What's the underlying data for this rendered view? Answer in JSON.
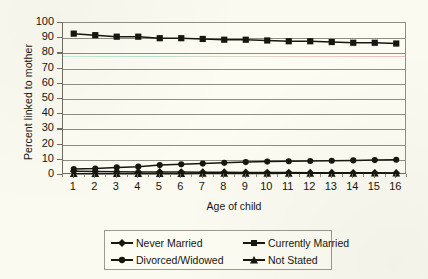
{
  "chart_data": {
    "type": "line",
    "title": "",
    "xlabel": "Age of child",
    "ylabel": "Percent linked to mother",
    "x": [
      1,
      2,
      3,
      4,
      5,
      6,
      7,
      8,
      9,
      10,
      11,
      12,
      13,
      14,
      15,
      16
    ],
    "xlim": [
      1,
      16
    ],
    "ylim": [
      0,
      100
    ],
    "yticks": [
      0,
      10,
      20,
      30,
      40,
      50,
      60,
      70,
      80,
      90,
      100
    ],
    "xticks": [
      1,
      2,
      3,
      4,
      5,
      6,
      7,
      8,
      9,
      10,
      11,
      12,
      13,
      14,
      15,
      16
    ],
    "grid": "horizontal",
    "legend_position": "bottom",
    "series": [
      {
        "name": "Never Married",
        "marker": "diamond",
        "values": [
          2.5,
          2.3,
          2.2,
          2.0,
          2.0,
          1.9,
          1.8,
          1.8,
          1.7,
          1.6,
          1.6,
          1.5,
          1.5,
          1.4,
          1.4,
          1.3
        ]
      },
      {
        "name": "Currently Married",
        "marker": "square",
        "values": [
          93,
          92,
          91,
          91,
          90,
          90,
          89.5,
          89,
          89,
          88.5,
          88,
          88,
          87.5,
          87,
          87,
          86.5
        ]
      },
      {
        "name": "Divorced/Widowed",
        "marker": "circle",
        "values": [
          4.0,
          4.3,
          5.0,
          5.5,
          6.5,
          7.0,
          7.5,
          8.0,
          8.5,
          8.8,
          9.0,
          9.2,
          9.4,
          9.6,
          9.8,
          10.0
        ]
      },
      {
        "name": "Not Stated",
        "marker": "triangle",
        "values": [
          0.8,
          0.8,
          0.8,
          0.9,
          0.9,
          0.9,
          1.0,
          1.0,
          1.0,
          1.0,
          1.1,
          1.1,
          1.1,
          1.1,
          1.2,
          1.2
        ]
      }
    ]
  },
  "colors": {
    "ink": "#17170f",
    "axis": "#6e6e64",
    "grid": "#8e8e83",
    "paper": "#fbfaf0",
    "plot_bg": "#fdfcf3",
    "legend_border": "#9a9a8e"
  },
  "legend": {
    "entries": [
      {
        "label": "Never Married",
        "marker": "diamond"
      },
      {
        "label": "Currently Married",
        "marker": "square"
      },
      {
        "label": "Divorced/Widowed",
        "marker": "circle"
      },
      {
        "label": "Not Stated",
        "marker": "triangle"
      }
    ]
  }
}
